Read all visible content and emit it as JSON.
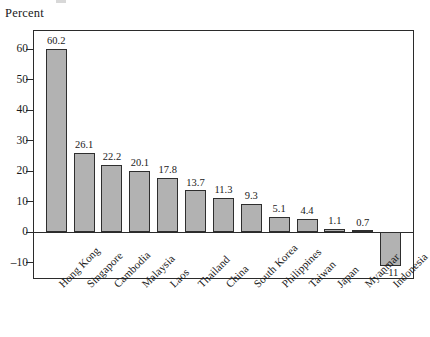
{
  "figure": {
    "axis_title": "Percent"
  },
  "chart_data": {
    "type": "bar",
    "title": "",
    "subtitle": "",
    "xlabel": "",
    "ylabel": "Percent",
    "categories": [
      "Hong Kong",
      "Singapore",
      "Cambodia",
      "Malaysia",
      "Laos",
      "Thailand",
      "China",
      "South Korea",
      "Philippines",
      "Taiwan",
      "Japan",
      "Myanmar",
      "Indonesia"
    ],
    "values": [
      60.2,
      26.1,
      22.2,
      20.1,
      17.8,
      13.7,
      11.3,
      9.3,
      5.1,
      4.4,
      1.1,
      0.7,
      -11
    ],
    "value_labels": [
      "60.2",
      "26.1",
      "22.2",
      "20.1",
      "17.8",
      "13.7",
      "11.3",
      "9.3",
      "5.1",
      "4.4",
      "1.1",
      "0.7",
      "–11"
    ],
    "ylim": [
      -15,
      66
    ],
    "yticks": [
      60,
      50,
      40,
      30,
      20,
      10,
      0,
      -10
    ],
    "ytick_labels": [
      "60",
      "50",
      "40",
      "30",
      "20",
      "10",
      "0",
      "–10"
    ],
    "grid": false,
    "legend": false,
    "bar_color": "#b2b2b2",
    "bar_edge_color": "#2e2e2e",
    "axis_color": "#2b2b2b"
  }
}
